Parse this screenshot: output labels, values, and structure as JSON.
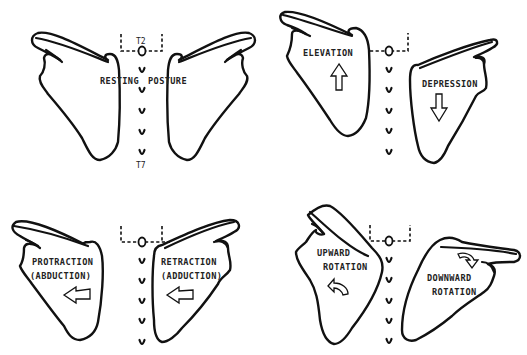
{
  "figure": {
    "stroke_color": "#111111",
    "background": "#ffffff"
  },
  "panels": [
    {
      "id": "resting",
      "labels": [
        "RESTING",
        "POSTURE"
      ],
      "vertebra_top": "T2",
      "vertebra_bottom": "T7"
    },
    {
      "id": "elevation-depression",
      "labels_left": [
        "ELEVATION"
      ],
      "labels_right": [
        "DEPRESSION"
      ],
      "arrows": [
        "arrow-up",
        "arrow-down"
      ]
    },
    {
      "id": "protraction-retraction",
      "labels_left": [
        "PROTRACTION",
        "(ABDUCTION)"
      ],
      "labels_right": [
        "RETRACTION",
        "(ADDUCTION)"
      ],
      "arrows": [
        "arrow-left",
        "arrow-left"
      ]
    },
    {
      "id": "rotation",
      "labels_left": [
        "UPWARD",
        "ROTATION"
      ],
      "labels_right": [
        "DOWNWARD",
        "ROTATION"
      ],
      "arrows": [
        "curved-arrow-upward-rotation",
        "curved-arrow-downward-rotation"
      ]
    }
  ]
}
